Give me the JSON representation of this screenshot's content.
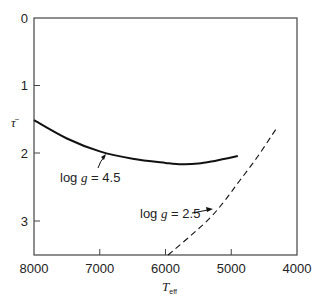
{
  "chart_data": {
    "type": "line",
    "title": "",
    "xlabel": "T_eff",
    "xlabel_main": "T",
    "xlabel_sub": "eff",
    "ylabel": "τ̄",
    "xlim": [
      8000,
      4000
    ],
    "ylim": [
      3.5,
      0
    ],
    "x_inverted": true,
    "y_inverted": true,
    "grid": false,
    "x_ticks": [
      8000,
      7000,
      6000,
      5000,
      4000
    ],
    "x_tick_labels": [
      "8000",
      "7000",
      "6000",
      "5000",
      "4000"
    ],
    "y_ticks": [
      0,
      1,
      2,
      3
    ],
    "y_tick_labels": [
      "0",
      "1",
      "2",
      "3"
    ],
    "series": [
      {
        "name": "log g = 4.5",
        "style": "solid",
        "x": [
          8000,
          7500,
          7000,
          6500,
          6000,
          5750,
          5500,
          5250,
          4900
        ],
        "values": [
          1.51,
          1.78,
          1.97,
          2.08,
          2.14,
          2.16,
          2.15,
          2.11,
          2.04
        ]
      },
      {
        "name": "log g = 2.5",
        "style": "dashed",
        "x": [
          5960,
          5600,
          5320,
          5100,
          4870,
          4600,
          4320
        ],
        "values": [
          3.5,
          3.2,
          2.95,
          2.7,
          2.4,
          2.05,
          1.64
        ]
      }
    ],
    "annotations": [
      {
        "text": "log g = 4.5",
        "prefix": "log ",
        "var": "g",
        "suffix": " = 4.5",
        "points_to": [
          6850,
          2.0
        ]
      },
      {
        "text": "log g = 2.5",
        "prefix": "log ",
        "var": "g",
        "suffix": " = 2.5",
        "points_to": [
          5300,
          2.85
        ]
      }
    ]
  }
}
